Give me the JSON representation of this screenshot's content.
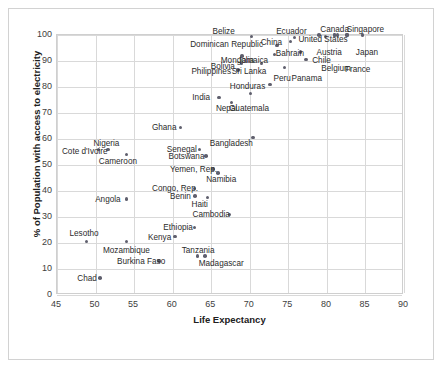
{
  "chart_data": {
    "type": "scatter",
    "title": "",
    "xlabel": "Life Expectancy",
    "ylabel": "% of Population with access to electricity",
    "xlim": [
      45,
      90
    ],
    "ylim": [
      0,
      100
    ],
    "xticks": [
      45,
      50,
      55,
      60,
      65,
      70,
      75,
      80,
      85,
      90
    ],
    "yticks": [
      0,
      10,
      20,
      30,
      40,
      50,
      60,
      70,
      80,
      90,
      100
    ],
    "grid": true,
    "legend": "none",
    "marker_color": "#5f5f6d",
    "points": [
      {
        "label": "Belize",
        "x": 70.2,
        "y": 99.5,
        "lx": 66.6,
        "ly": 101.5,
        "align": "c"
      },
      {
        "label": "Ecuador",
        "x": 75.8,
        "y": 99.0,
        "lx": 75.4,
        "ly": 101.5,
        "align": "c"
      },
      {
        "label": "Canada",
        "x": 81.4,
        "y": 100.0,
        "lx": 81.0,
        "ly": 102.5,
        "align": "c"
      },
      {
        "label": "Singapore",
        "x": 82.6,
        "y": 100.0,
        "lx": 85.0,
        "ly": 102.5,
        "align": "c"
      },
      {
        "label": "United States",
        "x": 79.0,
        "y": 100.0,
        "lx": 79.5,
        "ly": 98.5,
        "align": "c"
      },
      {
        "label": "Dominican Republic",
        "x": 73.5,
        "y": 96.0,
        "lx": 67.0,
        "ly": 96.5,
        "align": "c"
      },
      {
        "label": "China",
        "x": 75.3,
        "y": 97.5,
        "lx": 72.8,
        "ly": 97.5,
        "align": "c"
      },
      {
        "label": "Bahrain",
        "x": 76.6,
        "y": 93.5,
        "lx": 75.2,
        "ly": 93.0,
        "align": "c"
      },
      {
        "label": "Austria",
        "x": 81.0,
        "y": 100.0,
        "lx": 80.3,
        "ly": 93.5,
        "align": "c"
      },
      {
        "label": "Chile",
        "x": 79.8,
        "y": 99.5,
        "lx": 79.3,
        "ly": 90.5,
        "align": "c"
      },
      {
        "label": "Japan",
        "x": 84.6,
        "y": 100.0,
        "lx": 85.2,
        "ly": 93.5,
        "align": "c"
      },
      {
        "label": "Mongolia",
        "x": 69.0,
        "y": 92.0,
        "lx": 68.4,
        "ly": 90.5,
        "align": "c"
      },
      {
        "label": "Jamaica",
        "x": 73.2,
        "y": 92.5,
        "lx": 70.4,
        "ly": 90.5,
        "align": "c"
      },
      {
        "label": "Belgium",
        "x": 81.0,
        "y": 100.0,
        "lx": 81.2,
        "ly": 87.5,
        "align": "c"
      },
      {
        "label": "France",
        "x": 82.6,
        "y": 100.0,
        "lx": 84.0,
        "ly": 87.0,
        "align": "c"
      },
      {
        "label": "Bolivia",
        "x": 68.9,
        "y": 89.0,
        "lx": 66.5,
        "ly": 88.0,
        "align": "c"
      },
      {
        "label": "Sri Lanka",
        "x": 71.5,
        "y": 89.0,
        "lx": 69.9,
        "ly": 86.0,
        "align": "c"
      },
      {
        "label": "Philippines",
        "x": 68.5,
        "y": 86.5,
        "lx": 65.0,
        "ly": 86.0,
        "align": "c"
      },
      {
        "label": "Peru",
        "x": 74.5,
        "y": 87.5,
        "lx": 74.2,
        "ly": 83.5,
        "align": "c"
      },
      {
        "label": "Panama",
        "x": 77.3,
        "y": 90.5,
        "lx": 77.4,
        "ly": 83.5,
        "align": "c"
      },
      {
        "label": "Honduras",
        "x": 72.6,
        "y": 81.0,
        "lx": 69.7,
        "ly": 80.5,
        "align": "c"
      },
      {
        "label": "India",
        "x": 66.0,
        "y": 76.0,
        "lx": 63.7,
        "ly": 76.0,
        "align": "c"
      },
      {
        "label": "Guatemala",
        "x": 70.1,
        "y": 77.5,
        "lx": 69.9,
        "ly": 72.0,
        "align": "c"
      },
      {
        "label": "Nepal",
        "x": 67.6,
        "y": 74.0,
        "lx": 67.0,
        "ly": 72.0,
        "align": "c"
      },
      {
        "label": "Ghana",
        "x": 61.0,
        "y": 64.5,
        "lx": 58.9,
        "ly": 64.5,
        "align": "c"
      },
      {
        "label": "Bangladesh",
        "x": 70.4,
        "y": 60.5,
        "lx": 67.6,
        "ly": 58.5,
        "align": "c"
      },
      {
        "label": "Nigeria",
        "x": 51.6,
        "y": 56.0,
        "lx": 51.4,
        "ly": 58.5,
        "align": "c"
      },
      {
        "label": "Senegal",
        "x": 63.5,
        "y": 56.0,
        "lx": 61.2,
        "ly": 56.0,
        "align": "c"
      },
      {
        "label": "Cote d'Ivoire",
        "x": 50.4,
        "y": 56.0,
        "lx": 48.6,
        "ly": 55.5,
        "align": "c"
      },
      {
        "label": "Botswana",
        "x": 64.3,
        "y": 53.5,
        "lx": 61.8,
        "ly": 53.5,
        "align": "c"
      },
      {
        "label": "Cameroon",
        "x": 54.0,
        "y": 54.0,
        "lx": 52.9,
        "ly": 51.5,
        "align": "c"
      },
      {
        "label": "Yemen, Rep.",
        "x": 65.2,
        "y": 48.5,
        "lx": 62.7,
        "ly": 48.5,
        "align": "c"
      },
      {
        "label": "Namibia",
        "x": 65.9,
        "y": 47.0,
        "lx": 66.3,
        "ly": 44.5,
        "align": "c"
      },
      {
        "label": "Congo, Rep.",
        "x": 62.8,
        "y": 41.0,
        "lx": 60.3,
        "ly": 41.0,
        "align": "c"
      },
      {
        "label": "Benin",
        "x": 62.9,
        "y": 38.0,
        "lx": 61.0,
        "ly": 38.0,
        "align": "c"
      },
      {
        "label": "Haiti",
        "x": 64.5,
        "y": 37.5,
        "lx": 63.5,
        "ly": 35.0,
        "align": "c"
      },
      {
        "label": "Angola",
        "x": 54.0,
        "y": 37.0,
        "lx": 51.6,
        "ly": 37.0,
        "align": "c"
      },
      {
        "label": "Cambodia",
        "x": 67.4,
        "y": 31.0,
        "lx": 65.0,
        "ly": 31.0,
        "align": "c"
      },
      {
        "label": "Ethiopia",
        "x": 62.8,
        "y": 26.0,
        "lx": 60.7,
        "ly": 26.0,
        "align": "c"
      },
      {
        "label": "Kenya",
        "x": 60.3,
        "y": 22.5,
        "lx": 58.3,
        "ly": 22.5,
        "align": "c"
      },
      {
        "label": "Lesotho",
        "x": 48.8,
        "y": 20.5,
        "lx": 48.5,
        "ly": 24.0,
        "align": "c"
      },
      {
        "label": "Mozambique",
        "x": 54.0,
        "y": 20.5,
        "lx": 54.0,
        "ly": 17.5,
        "align": "c"
      },
      {
        "label": "Tanzania",
        "x": 63.2,
        "y": 15.0,
        "lx": 63.3,
        "ly": 17.5,
        "align": "c"
      },
      {
        "label": "Madagascar",
        "x": 64.2,
        "y": 15.0,
        "lx": 66.3,
        "ly": 12.5,
        "align": "c"
      },
      {
        "label": "Burkina Faso",
        "x": 58.2,
        "y": 13.0,
        "lx": 55.9,
        "ly": 13.0,
        "align": "c"
      },
      {
        "label": "Chad",
        "x": 50.6,
        "y": 6.5,
        "lx": 48.9,
        "ly": 6.5,
        "align": "c"
      }
    ]
  }
}
